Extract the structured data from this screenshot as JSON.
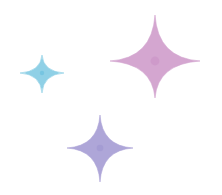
{
  "sparkles": [
    {
      "name": "pink-sparkle-icon",
      "cx": 155,
      "cy": 61,
      "left": 45,
      "right": 45,
      "up": 46,
      "down": 37,
      "waist": 8,
      "color": "#d4a6d0",
      "core": "#c98fc4"
    },
    {
      "name": "blue-sparkle-icon",
      "cx": 42,
      "cy": 73,
      "left": 22,
      "right": 22,
      "up": 18,
      "down": 20,
      "waist": 4,
      "color": "#8fd0e6",
      "core": "#62bcdc"
    },
    {
      "name": "purple-sparkle-icon",
      "cx": 100,
      "cy": 148,
      "left": 33,
      "right": 33,
      "up": 33,
      "down": 34,
      "waist": 6,
      "color": "#aea6d8",
      "core": "#9d93d0"
    }
  ]
}
